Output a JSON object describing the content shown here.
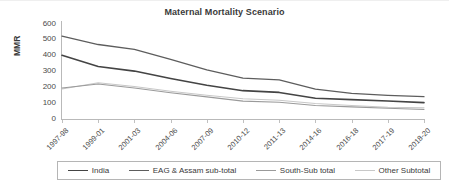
{
  "chart_data": {
    "type": "line",
    "title": "Maternal Mortality Scenario",
    "xlabel": "",
    "ylabel": "MMR",
    "ylim": [
      0,
      600
    ],
    "ytick_values": [
      600,
      500,
      400,
      300,
      200,
      100,
      0
    ],
    "ytick_labels": [
      "600",
      "500",
      "400",
      "300",
      "200",
      "100",
      "0"
    ],
    "grid": false,
    "legend_position": "bottom",
    "categories": [
      "1997-98",
      "1999-01",
      "2001-03",
      "2004-06",
      "2007-09",
      "2010-12",
      "2011-13",
      "2014-16",
      "2016-18",
      "2017-19",
      "2018-20"
    ],
    "series": [
      {
        "name": "India",
        "color": "#444444",
        "width": 1.6,
        "values": [
          400,
          330,
          301,
          254,
          212,
          178,
          167,
          130,
          122,
          113,
          103
        ]
      },
      {
        "name": "EAG & Assam sub-total",
        "color": "#5d5d5d",
        "width": 1.3,
        "values": [
          520,
          468,
          438,
          375,
          308,
          257,
          246,
          188,
          161,
          148,
          140
        ]
      },
      {
        "name": "South-Sub total",
        "color": "#9a9a9a",
        "width": 1.1,
        "values": [
          195,
          220,
          195,
          165,
          139,
          112,
          105,
          85,
          76,
          68,
          60
        ]
      },
      {
        "name": "Other Subtotal",
        "color": "#c8c8c8",
        "width": 1.1,
        "values": [
          188,
          228,
          204,
          174,
          149,
          127,
          118,
          97,
          85,
          74,
          70
        ]
      }
    ]
  },
  "legend": {
    "items": [
      {
        "label": "India"
      },
      {
        "label": "EAG & Assam sub-total"
      },
      {
        "label": "South-Sub total"
      },
      {
        "label": "Other Subtotal"
      }
    ]
  }
}
